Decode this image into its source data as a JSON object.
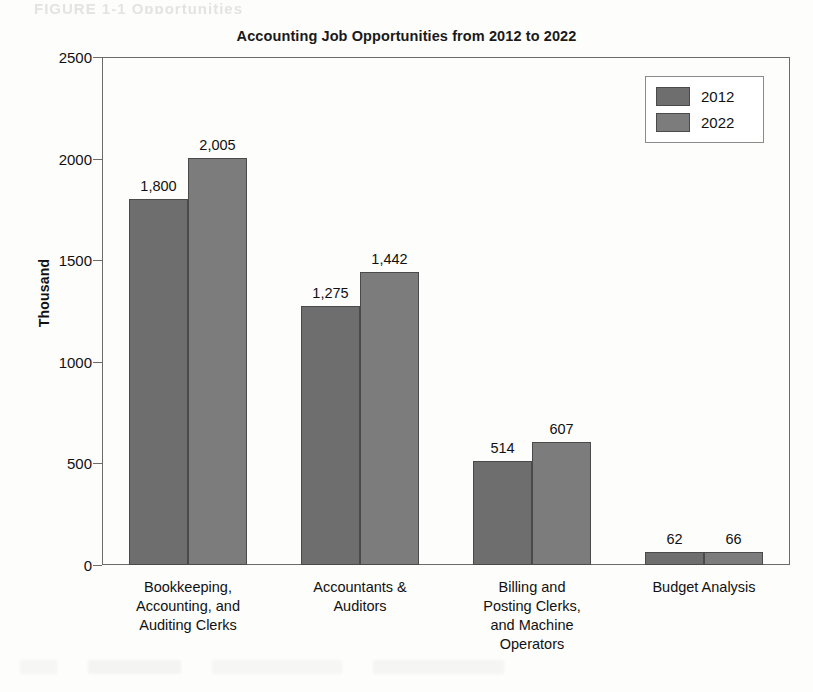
{
  "page": {
    "top_cut_text": "FIGURE 1-1   Opportunities"
  },
  "legend": {
    "position": "top-right",
    "entries": [
      {
        "label": "2012",
        "color": "#6e6e6e"
      },
      {
        "label": "2022",
        "color": "#7c7c7c"
      }
    ]
  },
  "chart_data": {
    "type": "bar",
    "title": "Accounting Job Opportunities from 2012 to 2022",
    "xlabel": "",
    "ylabel": "Thousand",
    "ylim": [
      0,
      2500
    ],
    "yticks": [
      0,
      500,
      1000,
      1500,
      2000,
      2500
    ],
    "ytick_labels": [
      "0",
      "500",
      "1000",
      "1500",
      "2000",
      "2500"
    ],
    "grid": false,
    "legend_position": "top-right",
    "categories": [
      "Bookkeeping,\nAccounting, and\nAuditing Clerks",
      "Accountants &\nAuditors",
      "Billing and\nPosting Clerks,\nand Machine\nOperators",
      "Budget Analysis"
    ],
    "series": [
      {
        "name": "2012",
        "color": "#6e6e6e",
        "values": [
          1800,
          1275,
          514,
          62
        ],
        "labels": [
          "1,800",
          "1,275",
          "514",
          "62"
        ]
      },
      {
        "name": "2022",
        "color": "#7c7c7c",
        "values": [
          2005,
          1442,
          607,
          66
        ],
        "labels": [
          "2,005",
          "1,442",
          "607",
          "66"
        ]
      }
    ]
  }
}
